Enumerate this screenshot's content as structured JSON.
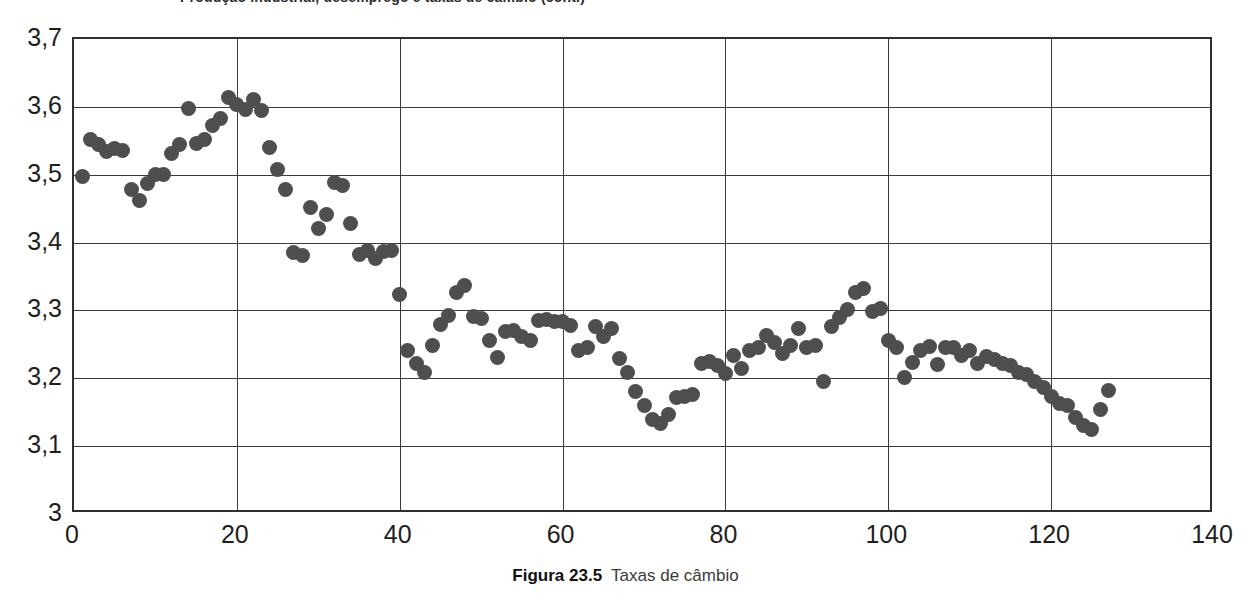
{
  "figure": {
    "clipped_title": "Produção industrial, desemprego e taxas de câmbio (cont.)",
    "caption_label": "Figura 23.5",
    "caption_text": "Taxas de câmbio"
  },
  "colors": {
    "marker": "#4e4e4e",
    "axis": "#2f2f2f",
    "grid": "#3a3a3a",
    "background": "#ffffff"
  },
  "chart_data": {
    "type": "scatter",
    "title": "",
    "xlabel": "",
    "ylabel": "",
    "xlim": [
      0,
      140
    ],
    "ylim": [
      3.0,
      3.7
    ],
    "grid": true,
    "legend": false,
    "xticks": [
      "0",
      "20",
      "40",
      "60",
      "80",
      "100",
      "120",
      "140"
    ],
    "xtick_values": [
      0,
      20,
      40,
      60,
      80,
      100,
      120,
      140
    ],
    "yticks": [
      "3",
      "3,1",
      "3,2",
      "3,3",
      "3,4",
      "3,5",
      "3,6",
      "3,7"
    ],
    "ytick_values": [
      3.0,
      3.1,
      3.2,
      3.3,
      3.4,
      3.5,
      3.6,
      3.7
    ],
    "decimal_separator": ",",
    "marker_size_px": 15,
    "series": [
      {
        "name": "Taxa de câmbio",
        "points": [
          [
            1,
            3.497
          ],
          [
            2,
            3.552
          ],
          [
            3,
            3.545
          ],
          [
            4,
            3.534
          ],
          [
            5,
            3.538
          ],
          [
            6,
            3.536
          ],
          [
            7,
            3.478
          ],
          [
            8,
            3.462
          ],
          [
            9,
            3.487
          ],
          [
            10,
            3.501
          ],
          [
            11,
            3.501
          ],
          [
            12,
            3.531
          ],
          [
            13,
            3.544
          ],
          [
            14,
            3.597
          ],
          [
            15,
            3.546
          ],
          [
            16,
            3.552
          ],
          [
            17,
            3.573
          ],
          [
            18,
            3.583
          ],
          [
            19,
            3.614
          ],
          [
            20,
            3.604
          ],
          [
            21,
            3.596
          ],
          [
            22,
            3.611
          ],
          [
            23,
            3.595
          ],
          [
            24,
            3.54
          ],
          [
            25,
            3.508
          ],
          [
            26,
            3.478
          ],
          [
            27,
            3.386
          ],
          [
            28,
            3.381
          ],
          [
            29,
            3.452
          ],
          [
            30,
            3.421
          ],
          [
            31,
            3.441
          ],
          [
            32,
            3.489
          ],
          [
            33,
            3.484
          ],
          [
            34,
            3.428
          ],
          [
            35,
            3.383
          ],
          [
            36,
            3.389
          ],
          [
            37,
            3.377
          ],
          [
            38,
            3.387
          ],
          [
            39,
            3.389
          ],
          [
            40,
            3.324
          ],
          [
            41,
            3.241
          ],
          [
            42,
            3.222
          ],
          [
            43,
            3.208
          ],
          [
            44,
            3.248
          ],
          [
            45,
            3.28
          ],
          [
            46,
            3.293
          ],
          [
            47,
            3.327
          ],
          [
            48,
            3.337
          ],
          [
            49,
            3.291
          ],
          [
            50,
            3.288
          ],
          [
            51,
            3.256
          ],
          [
            52,
            3.231
          ],
          [
            53,
            3.269
          ],
          [
            54,
            3.271
          ],
          [
            55,
            3.261
          ],
          [
            56,
            3.255
          ],
          [
            57,
            3.285
          ],
          [
            58,
            3.287
          ],
          [
            59,
            3.283
          ],
          [
            60,
            3.284
          ],
          [
            61,
            3.278
          ],
          [
            62,
            3.241
          ],
          [
            63,
            3.245
          ],
          [
            64,
            3.276
          ],
          [
            65,
            3.261
          ],
          [
            66,
            3.274
          ],
          [
            67,
            3.229
          ],
          [
            68,
            3.208
          ],
          [
            69,
            3.181
          ],
          [
            70,
            3.16
          ],
          [
            71,
            3.14
          ],
          [
            72,
            3.134
          ],
          [
            73,
            3.146
          ],
          [
            74,
            3.172
          ],
          [
            75,
            3.173
          ],
          [
            76,
            3.176
          ],
          [
            77,
            3.222
          ],
          [
            78,
            3.225
          ],
          [
            79,
            3.219
          ],
          [
            80,
            3.207
          ],
          [
            81,
            3.233
          ],
          [
            82,
            3.215
          ],
          [
            83,
            3.241
          ],
          [
            84,
            3.246
          ],
          [
            85,
            3.263
          ],
          [
            86,
            3.253
          ],
          [
            87,
            3.236
          ],
          [
            88,
            3.248
          ],
          [
            89,
            3.274
          ],
          [
            90,
            3.245
          ],
          [
            91,
            3.248
          ],
          [
            92,
            3.196
          ],
          [
            93,
            3.277
          ],
          [
            94,
            3.289
          ],
          [
            95,
            3.301
          ],
          [
            96,
            3.327
          ],
          [
            97,
            3.333
          ],
          [
            98,
            3.298
          ],
          [
            99,
            3.303
          ],
          [
            100,
            3.256
          ],
          [
            101,
            3.245
          ],
          [
            102,
            3.201
          ],
          [
            103,
            3.224
          ],
          [
            104,
            3.241
          ],
          [
            105,
            3.247
          ],
          [
            106,
            3.22
          ],
          [
            107,
            3.246
          ],
          [
            108,
            3.246
          ],
          [
            109,
            3.233
          ],
          [
            110,
            3.241
          ],
          [
            111,
            3.222
          ],
          [
            112,
            3.232
          ],
          [
            113,
            3.227
          ],
          [
            114,
            3.222
          ],
          [
            115,
            3.219
          ],
          [
            116,
            3.208
          ],
          [
            117,
            3.205
          ],
          [
            118,
            3.196
          ],
          [
            119,
            3.186
          ],
          [
            120,
            3.173
          ],
          [
            121,
            3.163
          ],
          [
            122,
            3.16
          ],
          [
            123,
            3.142
          ],
          [
            124,
            3.131
          ],
          [
            125,
            3.124
          ],
          [
            126,
            3.154
          ],
          [
            127,
            3.182
          ]
        ]
      }
    ]
  }
}
